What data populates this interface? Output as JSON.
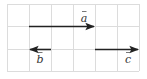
{
  "diagram": {
    "type": "vector-grid",
    "grid": {
      "cols": 6,
      "rows": 3,
      "origin_x": 7,
      "origin_y": 4,
      "cell": 22,
      "line_color": "#dcdcdc"
    },
    "vectors": [
      {
        "name": "a",
        "label": "a",
        "row_line": 1,
        "from_col": 1,
        "to_col": 4,
        "direction": "right",
        "label_col": 3.5,
        "label_pos": "above"
      },
      {
        "name": "b",
        "label": "b",
        "row_line": 2,
        "from_col": 2,
        "to_col": 1,
        "direction": "left",
        "label_col": 1.5,
        "label_pos": "below"
      },
      {
        "name": "c",
        "label": "c",
        "row_line": 2,
        "from_col": 4,
        "to_col": 6,
        "direction": "right",
        "label_col": 5.5,
        "label_pos": "below"
      }
    ],
    "arrow_color": "#222222"
  }
}
